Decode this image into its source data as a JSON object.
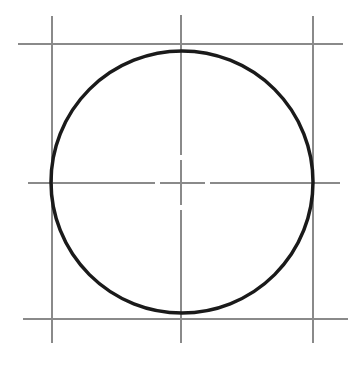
{
  "diagram": {
    "title": "",
    "colors": {
      "background": "#ffffff",
      "construction_line": "#8a8a8a",
      "circle_stroke": "#1a1a1a"
    },
    "circle": {
      "cx": 182,
      "cy": 182,
      "r": 131,
      "stroke_width": 3.5
    },
    "square_lines": {
      "top": {
        "x1": 18,
        "y1": 44,
        "x2": 343,
        "y2": 44
      },
      "bottom": {
        "x1": 23,
        "y1": 319,
        "x2": 348,
        "y2": 319
      },
      "left": {
        "x1": 52,
        "y1": 16,
        "x2": 52,
        "y2": 343
      },
      "right": {
        "x1": 313,
        "y1": 16,
        "x2": 313,
        "y2": 343
      }
    },
    "center_lines": {
      "horizontal": {
        "y": 183,
        "x_start": 28,
        "x_end": 340,
        "gaps": [
          [
            155,
            160
          ],
          [
            205,
            210
          ]
        ]
      },
      "vertical": {
        "x": 181,
        "y_start": 15,
        "y_end": 343,
        "gaps": [
          [
            155,
            160
          ],
          [
            205,
            210
          ]
        ]
      }
    }
  }
}
